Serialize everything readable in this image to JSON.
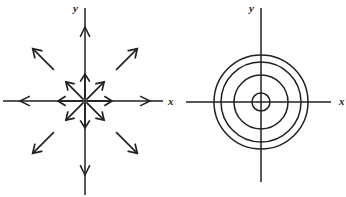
{
  "figure": {
    "background_color": "#ffffff",
    "ink_color": "#231f20",
    "width": 346,
    "height": 197,
    "panels": [
      {
        "id": "left-panel",
        "name": "radial-outward-vector-field",
        "description": "Phase portrait: unstable node / source with radially outward arrows",
        "center": {
          "x": 85,
          "y": 101
        },
        "axes": {
          "x_axis": {
            "label": "x",
            "label_position": {
              "x": 168,
              "y": 105
            },
            "line_start": {
              "x": 3,
              "y": 101
            },
            "line_end": {
              "x": 163,
              "y": 101
            },
            "arrow_left_tip": {
              "x": 20,
              "y": 101
            },
            "arrow_right_tip": {
              "x": 150,
              "y": 101
            }
          },
          "y_axis": {
            "label": "y",
            "label_position": {
              "x": 73,
              "y": 12
            },
            "line_start": {
              "x": 85,
              "y": 8
            },
            "line_end": {
              "x": 85,
              "y": 195
            },
            "arrow_up_tip": {
              "x": 85,
              "y": 27
            },
            "arrow_down_tip": {
              "x": 85,
              "y": 175
            }
          }
        },
        "vector_field": {
          "type": "radial-outward",
          "direction_count": 8,
          "directions_deg": [
            0,
            45,
            90,
            135,
            180,
            225,
            270,
            315
          ],
          "inner_arrow_start_radius": 2,
          "inner_arrow_tip_radius": 27,
          "outer_arrow_start_radius": 44,
          "outer_arrow_tip_radius": 74,
          "arrow_head_length": 9,
          "arrow_head_half_angle_deg": 32
        }
      },
      {
        "id": "right-panel",
        "name": "concentric-closed-orbits",
        "description": "Phase portrait: center with four concentric closed circular orbits",
        "center": {
          "x": 261,
          "y": 102
        },
        "axes": {
          "x_axis": {
            "label": "x",
            "label_position": {
              "x": 339,
              "y": 105
            },
            "line_start": {
              "x": 186,
              "y": 102
            },
            "line_end": {
              "x": 331,
              "y": 102
            }
          },
          "y_axis": {
            "label": "y",
            "label_position": {
              "x": 249,
              "y": 12
            },
            "line_start": {
              "x": 261,
              "y": 8
            },
            "line_end": {
              "x": 261,
              "y": 182
            }
          }
        },
        "orbits": {
          "type": "concentric-circles",
          "count": 4,
          "radii": [
            9,
            27,
            40,
            47
          ]
        }
      }
    ]
  }
}
